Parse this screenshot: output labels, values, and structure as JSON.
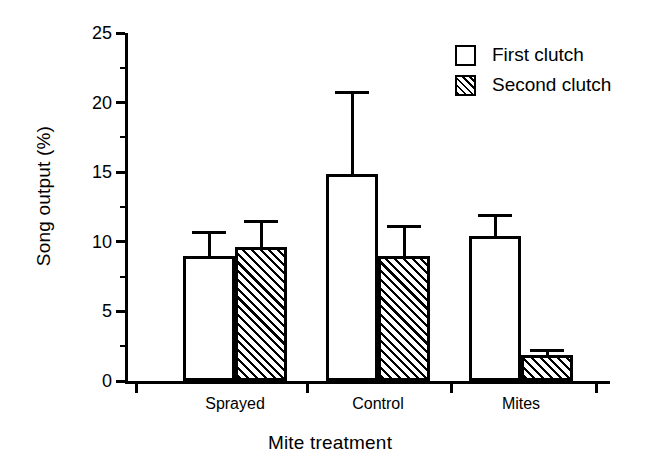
{
  "chart_data": {
    "type": "bar",
    "title": "",
    "xlabel": "Mite treatment",
    "ylabel": "Song output (%)",
    "categories": [
      "Sprayed",
      "Control",
      "Mites"
    ],
    "ylim": [
      0,
      25
    ],
    "yticks": [
      0,
      5,
      10,
      15,
      20,
      25
    ],
    "ytick_labels": [
      "0",
      "5",
      "10",
      "15",
      "20",
      "25"
    ],
    "yminor_ticks": [
      2.5,
      7.5,
      12.5,
      17.5,
      22.5
    ],
    "grid": false,
    "legend_position": "top-right",
    "series": [
      {
        "name": "First clutch",
        "fill": "open",
        "values": [
          9.0,
          14.9,
          10.4
        ],
        "errors": [
          1.8,
          5.9,
          1.6
        ],
        "error_tops": [
          10.8,
          20.8,
          12.0
        ]
      },
      {
        "name": "Second clutch",
        "fill": "hatched",
        "values": [
          9.6,
          9.0,
          1.9
        ],
        "errors": [
          2.0,
          2.2,
          0.4
        ],
        "error_tops": [
          11.6,
          11.2,
          2.3
        ]
      }
    ]
  },
  "legend": {
    "entries": [
      {
        "label": "First clutch",
        "swatch": "open-square-swatch"
      },
      {
        "label": "Second clutch",
        "swatch": "hatched-square-swatch"
      }
    ]
  }
}
